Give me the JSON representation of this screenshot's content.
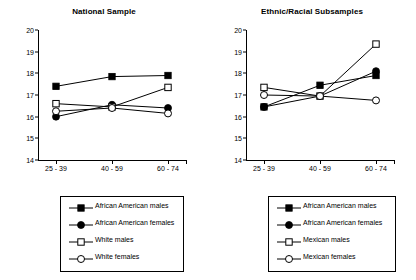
{
  "chart_data": [
    {
      "type": "line",
      "title": "National Sample",
      "xlabel": "",
      "ylabel": "",
      "categories": [
        "25 - 39",
        "40 - 59",
        "60 - 74"
      ],
      "ylim": [
        14,
        20
      ],
      "yticks": [
        20,
        19,
        18,
        17,
        16,
        15,
        14
      ],
      "grid": false,
      "legend_position": "below",
      "series": [
        {
          "name": "African American males",
          "marker": "filled-square",
          "values": [
            17.4,
            17.85,
            17.9
          ]
        },
        {
          "name": "African American females",
          "marker": "filled-circle",
          "values": [
            16.0,
            16.55,
            16.4
          ]
        },
        {
          "name": "White males",
          "marker": "open-square",
          "values": [
            16.6,
            16.45,
            17.35
          ]
        },
        {
          "name": "White females",
          "marker": "open-circle",
          "values": [
            16.25,
            16.4,
            16.15
          ]
        }
      ]
    },
    {
      "type": "line",
      "title": "Ethnic/Racial Subsamples",
      "xlabel": "",
      "ylabel": "",
      "categories": [
        "25 - 39",
        "40 - 59",
        "60 - 74"
      ],
      "ylim": [
        14,
        20
      ],
      "yticks": [
        20,
        19,
        18,
        17,
        16,
        15,
        14
      ],
      "grid": false,
      "legend_position": "below",
      "series": [
        {
          "name": "African American males",
          "marker": "filled-square",
          "values": [
            16.45,
            17.45,
            17.9
          ]
        },
        {
          "name": "African American females",
          "marker": "filled-circle",
          "values": [
            16.45,
            16.95,
            18.1
          ]
        },
        {
          "name": "Mexican males",
          "marker": "open-square",
          "values": [
            17.35,
            16.95,
            19.35
          ]
        },
        {
          "name": "Mexican females",
          "marker": "open-circle",
          "values": [
            17.0,
            16.95,
            16.75
          ]
        }
      ]
    }
  ],
  "left_panel": {
    "title": "National Sample",
    "yticks": [
      "20",
      "19",
      "18",
      "17",
      "16",
      "15",
      "14"
    ],
    "xticks": [
      "25 - 39",
      "40 - 59",
      "60 - 74"
    ],
    "legend": [
      {
        "label": "African American males",
        "marker": "filled-square"
      },
      {
        "label": "African American females",
        "marker": "filled-circle"
      },
      {
        "label": "White males",
        "marker": "open-square"
      },
      {
        "label": "White females",
        "marker": "open-circle"
      }
    ]
  },
  "right_panel": {
    "title": "Ethnic/Racial Subsamples",
    "yticks": [
      "20",
      "19",
      "18",
      "17",
      "16",
      "15",
      "14"
    ],
    "xticks": [
      "25 - 39",
      "40 - 59",
      "60 - 74"
    ],
    "legend": [
      {
        "label": "African American males",
        "marker": "filled-square"
      },
      {
        "label": "African American females",
        "marker": "filled-circle"
      },
      {
        "label": "Mexican males",
        "marker": "open-square"
      },
      {
        "label": "Mexican females",
        "marker": "open-circle"
      }
    ]
  },
  "colors": {
    "line": "#000000",
    "axis": "#000000",
    "background": "#ffffff"
  }
}
